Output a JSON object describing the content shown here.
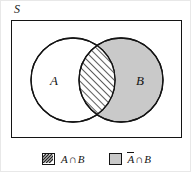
{
  "figure": {
    "universe_label": "S",
    "set_a_label": "A",
    "set_b_label": "B",
    "colors": {
      "stroke": "#141414",
      "set_b_fill": "#c9c9c9",
      "set_a_fill": "#ffffff",
      "hatch_fill": "#ffffff",
      "hatch_line": "#262626",
      "background": "#ffffff",
      "page_border": "#e8e8e8"
    },
    "geometry": {
      "rect": {
        "x": 10,
        "y": 19,
        "width": 171,
        "height": 118
      },
      "circle_a": {
        "cx": 62,
        "cy": 60,
        "r": 42
      },
      "circle_b": {
        "cx": 110,
        "cy": 60,
        "r": 42
      },
      "hatch_angle_deg": 45
    }
  },
  "legend": {
    "items": [
      {
        "swatch": "hatched-swatch",
        "left": "A",
        "operator": "∩",
        "right": "B",
        "overline_left": false,
        "text": "A ∩ B"
      },
      {
        "swatch": "gray-swatch",
        "left": "A",
        "operator": "∩",
        "right": "B",
        "overline_left": true,
        "text": "Ā ∩ B"
      }
    ]
  }
}
